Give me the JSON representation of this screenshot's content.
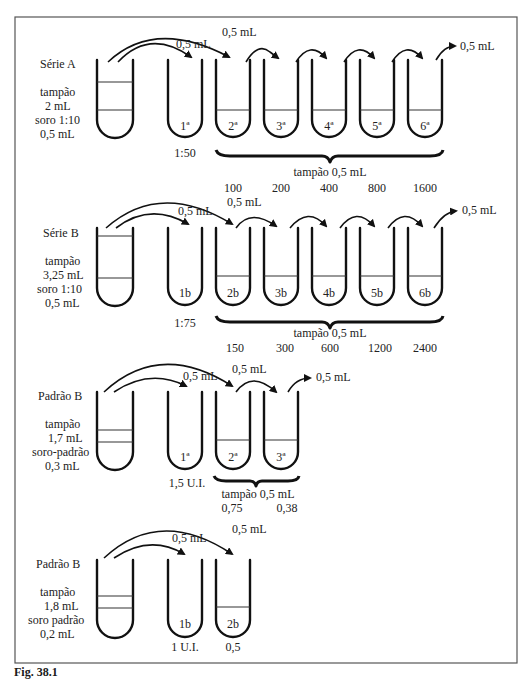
{
  "figure": {
    "caption_partial": "Fig. 38.1",
    "transfer_volume": "0,5 mL"
  },
  "series_a": {
    "title": "Série A",
    "source": [
      "tampão",
      "2 mL",
      "soro 1:10",
      "0,5 mL"
    ],
    "tubes": [
      "1ª",
      "2ª",
      "3ª",
      "4ª",
      "5ª",
      "6ª"
    ],
    "first_dilution": "1:50",
    "buffer_label": "tampão 0,5 mL",
    "titers": [
      "100",
      "200",
      "400",
      "800",
      "1600"
    ],
    "transfer_labels": [
      "0,5 mL",
      "0,5 mL",
      "0,5 mL"
    ]
  },
  "series_b": {
    "title": "Série B",
    "source": [
      "tampão",
      "3,25 mL",
      "soro 1:10",
      "0,5 mL"
    ],
    "tubes": [
      "1b",
      "2b",
      "3b",
      "4b",
      "5b",
      "6b"
    ],
    "first_dilution": "1:75",
    "buffer_label": "tampão 0,5 mL",
    "titers": [
      "150",
      "300",
      "600",
      "1200",
      "2400"
    ],
    "transfer_labels": [
      "0,5 mL",
      "0,5 mL",
      "0,5 mL"
    ]
  },
  "standard_b1": {
    "title": "Padrão B",
    "source": [
      "tampão",
      "1,7 mL",
      "soro-padrão",
      "0,3 mL"
    ],
    "tubes": [
      "1ª",
      "2ª",
      "3ª"
    ],
    "first_value": "1,5 U.I.",
    "buffer_label": "tampão 0,5 mL",
    "values": [
      "0,75",
      "0,38"
    ],
    "transfer_labels": [
      "0,5 mL",
      "0,5 mL",
      "0,5 mL"
    ]
  },
  "standard_b2": {
    "title": "Padrão B",
    "source": [
      "tampão",
      "1,8 mL",
      "soro padrão",
      "0,2 mL"
    ],
    "tubes": [
      "1b",
      "2b"
    ],
    "values": [
      "1 U.I.",
      "0,5"
    ],
    "transfer_labels": [
      "0,5 mL",
      "0,5 mL"
    ]
  },
  "colors": {
    "ink": "#111111",
    "frame": "#555555",
    "background": "#ffffff"
  }
}
